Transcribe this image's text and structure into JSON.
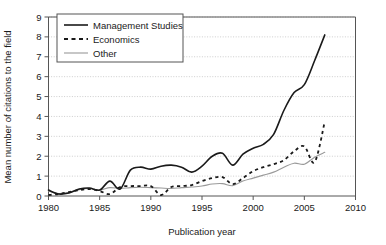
{
  "chart_data": {
    "type": "line",
    "title": "",
    "xlabel": "Publication year",
    "ylabel": "Mean number of citations to the field",
    "xlim": [
      1980,
      2010
    ],
    "ylim": [
      0,
      9
    ],
    "xticks": [
      1980,
      1985,
      1990,
      1995,
      2000,
      2005,
      2010
    ],
    "yticks": [
      0,
      1,
      2,
      3,
      4,
      5,
      6,
      7,
      8,
      9
    ],
    "grid": "horizontal-dotted",
    "legend_position": "top-left",
    "x": [
      1980,
      1981,
      1982,
      1983,
      1984,
      1985,
      1986,
      1987,
      1988,
      1989,
      1990,
      1991,
      1992,
      1993,
      1994,
      1995,
      1996,
      1997,
      1998,
      1999,
      2000,
      2001,
      2002,
      2003,
      2004,
      2005,
      2006,
      2007
    ],
    "series": [
      {
        "name": "Management Studies",
        "color": "#1a1a1a",
        "style": "solid",
        "width": 1.6,
        "values": [
          0.3,
          0.1,
          0.15,
          0.35,
          0.4,
          0.3,
          0.75,
          0.35,
          1.3,
          1.45,
          1.35,
          1.5,
          1.55,
          1.45,
          1.2,
          1.5,
          2.0,
          2.15,
          1.55,
          2.1,
          2.4,
          2.6,
          3.1,
          4.3,
          5.2,
          5.6,
          6.8,
          8.1
        ]
      },
      {
        "name": "Economics",
        "color": "#1a1a1a",
        "style": "dashed",
        "width": 1.8,
        "values": [
          0.05,
          0.1,
          0.2,
          0.3,
          0.35,
          0.25,
          0.1,
          0.45,
          0.5,
          0.5,
          0.5,
          0.05,
          0.45,
          0.5,
          0.55,
          0.75,
          0.9,
          0.95,
          0.6,
          0.9,
          1.25,
          1.45,
          1.6,
          1.8,
          2.25,
          2.5,
          1.7,
          3.75
        ]
      },
      {
        "name": "Other",
        "color": "#9a9a9a",
        "style": "solid",
        "width": 1.1,
        "values": [
          0.25,
          0.12,
          0.18,
          0.32,
          0.38,
          0.3,
          0.42,
          0.38,
          0.42,
          0.44,
          0.42,
          0.4,
          0.38,
          0.42,
          0.45,
          0.5,
          0.6,
          0.62,
          0.52,
          0.75,
          0.9,
          1.05,
          1.2,
          1.45,
          1.65,
          1.6,
          1.95,
          2.2
        ]
      }
    ]
  },
  "axes": {
    "y_label": "Mean number of citations to the field",
    "x_label": "Publication year",
    "x_tick_labels": [
      "1980",
      "1985",
      "1990",
      "1995",
      "2000",
      "2005",
      "2010"
    ],
    "y_tick_labels": [
      "0",
      "1",
      "2",
      "3",
      "4",
      "5",
      "6",
      "7",
      "8",
      "9"
    ]
  },
  "legend": {
    "entries": [
      {
        "label": "Management Studies"
      },
      {
        "label": "Economics"
      },
      {
        "label": "Other"
      }
    ]
  },
  "colors": {
    "line_dark": "#1a1a1a",
    "line_gray": "#9a9a9a",
    "grid": "#c8c8c8",
    "axis": "#555555",
    "background": "#ffffff"
  }
}
